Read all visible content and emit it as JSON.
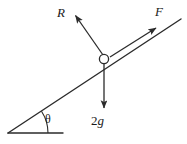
{
  "figure": {
    "background_color": "#ffffff",
    "stroke_color": "#2b2b2b",
    "text_color": "#1a1a1a",
    "width": 187,
    "height": 144
  },
  "labels": {
    "normal_force": "R",
    "applied_force": "F",
    "angle": "θ",
    "weight_coefficient": "2",
    "weight_symbol": "g",
    "weight_full": "2g"
  },
  "geometry": {
    "incline": {
      "x1": 8,
      "y1": 133,
      "x2": 181,
      "y2": 19
    },
    "baseline": {
      "x1": 8,
      "y1": 133,
      "x2": 63,
      "y2": 133
    },
    "angle_arc": {
      "cx": 8,
      "cy": 133,
      "radius": 40,
      "sweep_degrees": 33
    },
    "particle": {
      "cx": 104,
      "cy": 59,
      "r": 4.5
    },
    "normal_force_vector": {
      "x1": 103,
      "y1": 55,
      "x2": 74,
      "y2": 14
    },
    "applied_force_vector": {
      "x1": 111,
      "y1": 57,
      "x2": 158,
      "y2": 27
    },
    "weight_vector": {
      "x1": 104,
      "y1": 64,
      "x2": 104,
      "y2": 110
    }
  }
}
